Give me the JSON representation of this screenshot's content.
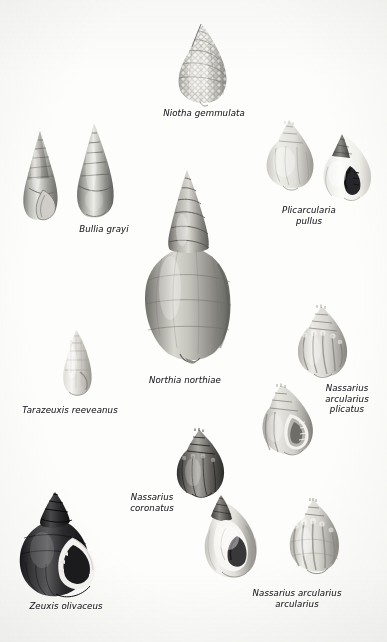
{
  "plate": {
    "kind": "scientific-illustration-plate",
    "medium": "black-and-white halftone photographic plate",
    "subject": "Marine gastropod shells (family Nassariidae)",
    "background_color": "#fdfdfb",
    "ink_color": "#24242a",
    "width": 387,
    "height": 642
  },
  "labels": [
    {
      "id": "niotha-gemmulata",
      "text": "Niotha gemmulata",
      "x": 204,
      "y": 108,
      "lines": 1
    },
    {
      "id": "bullia-grayi",
      "text": "Bullia grayi",
      "x": 104,
      "y": 224,
      "lines": 1
    },
    {
      "id": "plicarcularia-pullus",
      "text": "Plicarcularia\npullus",
      "x": 309,
      "y": 205,
      "lines": 2
    },
    {
      "id": "northia-northiae",
      "text": "Northia northiae",
      "x": 185,
      "y": 375,
      "lines": 1
    },
    {
      "id": "tarazeuxis-reeveanus",
      "text": "Tarazeuxis reeveanus",
      "x": 70,
      "y": 405,
      "lines": 1
    },
    {
      "id": "nassarius-arcularius-plicatus",
      "text": "Nassarius\narcularius\nplicatus",
      "x": 347,
      "y": 383,
      "lines": 3
    },
    {
      "id": "nassarius-coronatus",
      "text": "Nassarius\ncoronatus",
      "x": 152,
      "y": 492,
      "lines": 2
    },
    {
      "id": "zeuxis-olivaceus",
      "text": "Zeuxis olivaceus",
      "x": 66,
      "y": 601,
      "lines": 1
    },
    {
      "id": "nassarius-arcularius-arcularius",
      "text": "Nassarius arcularius\narcularius",
      "x": 297,
      "y": 588,
      "lines": 2
    }
  ],
  "figures": [
    {
      "id": "bullia-grayi-left",
      "species": "Bullia grayi",
      "view": "apertural",
      "x": 16,
      "y": 130,
      "w": 50,
      "h": 92,
      "tone": "mid-grey",
      "form": "high-spired-fusiform"
    },
    {
      "id": "bullia-grayi-right",
      "species": "Bullia grayi",
      "view": "dorsal",
      "x": 68,
      "y": 122,
      "w": 52,
      "h": 100,
      "tone": "mid-grey",
      "form": "high-spired-fusiform"
    },
    {
      "id": "niotha-gemmulata-1",
      "species": "Niotha gemmulata",
      "view": "dorsal",
      "x": 168,
      "y": 22,
      "w": 70,
      "h": 86,
      "tone": "light-grey",
      "form": "beaded-ovate"
    },
    {
      "id": "plicarcularia-pullus-dorsal",
      "species": "Plicarcularia pullus",
      "view": "dorsal",
      "x": 258,
      "y": 118,
      "w": 62,
      "h": 80,
      "tone": "light-grey",
      "form": "globose-ribbed"
    },
    {
      "id": "plicarcularia-pullus-apertural",
      "species": "Plicarcularia pullus",
      "view": "apertural",
      "x": 316,
      "y": 132,
      "w": 62,
      "h": 76,
      "tone": "white",
      "form": "globose-dark-aperture"
    },
    {
      "id": "northia-northiae-1",
      "species": "Northia northiae",
      "view": "dorsal",
      "x": 140,
      "y": 168,
      "w": 96,
      "h": 200,
      "tone": "mid-dark-grey",
      "form": "large-high-spired-ovate"
    },
    {
      "id": "tarazeuxis-reeveanus-1",
      "species": "Tarazeuxis reeveanus",
      "view": "dorsal",
      "x": 56,
      "y": 328,
      "w": 44,
      "h": 72,
      "tone": "pale-grey",
      "form": "slender-conical"
    },
    {
      "id": "nassarius-arcularius-plicatus-upper",
      "species": "Nassarius arcularius plicatus",
      "view": "dorsal",
      "x": 288,
      "y": 304,
      "w": 66,
      "h": 82,
      "tone": "light-grey",
      "form": "nodulose-ribbed"
    },
    {
      "id": "nassarius-arcularius-plicatus-lower",
      "species": "Nassarius arcularius plicatus",
      "view": "apertural",
      "x": 256,
      "y": 382,
      "w": 66,
      "h": 82,
      "tone": "light-grey",
      "form": "nodulose-ribbed"
    },
    {
      "id": "nassarius-coronatus-1",
      "species": "Nassarius coronatus",
      "view": "dorsal",
      "x": 168,
      "y": 428,
      "w": 62,
      "h": 76,
      "tone": "dark-grey",
      "form": "coronate-ovate"
    },
    {
      "id": "nassarius-coronatus-2",
      "species": "Nassarius coronatus",
      "view": "apertural",
      "x": 196,
      "y": 492,
      "w": 68,
      "h": 92,
      "tone": "grey-white",
      "form": "coronate-ovate-aperture"
    },
    {
      "id": "zeuxis-olivaceus-1",
      "species": "Zeuxis olivaceus",
      "view": "apertural",
      "x": 10,
      "y": 490,
      "w": 96,
      "h": 110,
      "tone": "near-black",
      "form": "dark-ovate-toothed-aperture"
    },
    {
      "id": "nassarius-arcularius-arcularius-1",
      "species": "Nassarius arcularius arcularius",
      "view": "dorsal",
      "x": 280,
      "y": 498,
      "w": 66,
      "h": 84,
      "tone": "light-grey",
      "form": "strongly-ribbed-ovate"
    }
  ]
}
